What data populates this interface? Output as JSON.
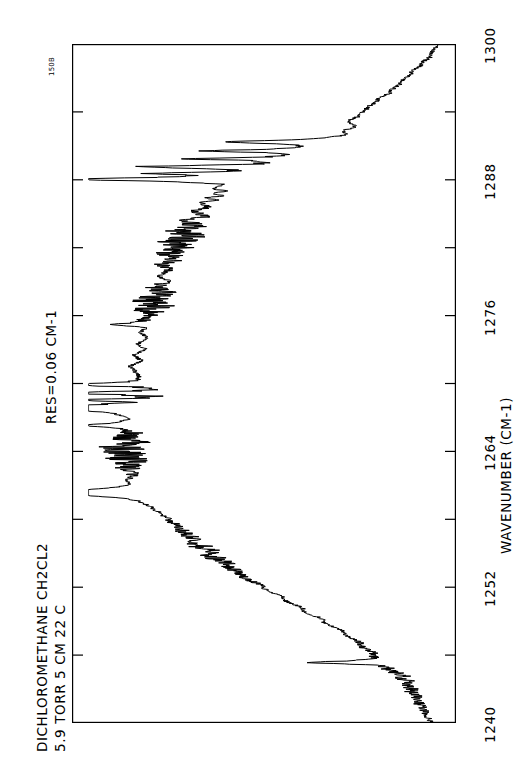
{
  "header": {
    "sample_name": "DICHLOROMETHANE  CH2CL2",
    "conditions": "5.9 TORR  5 CM  22 C",
    "resolution": "RES=0.06 CM-1",
    "spectrum_id": "150B"
  },
  "chart_data": {
    "type": "line",
    "title": "DICHLOROMETHANE  CH2CL2",
    "subtitle": "5.9 TORR  5 CM  22 C",
    "annotations": [
      "RES=0.06 CM-1",
      "150B"
    ],
    "orientation": "rotated-90-clockwise",
    "xlabel": "WAVENUMBER (CM-1)",
    "ylabel": "",
    "xlim": [
      1300,
      1240
    ],
    "ylim": [
      0,
      1
    ],
    "grid": false,
    "legend": null,
    "axis_side": "right",
    "tick_labels": [
      "1300",
      "1288",
      "1276",
      "1264",
      "1252",
      "1240"
    ],
    "tick_values": [
      1300,
      1288,
      1276,
      1264,
      1252,
      1240
    ],
    "minor_tick_values": [
      1294,
      1282,
      1270,
      1258,
      1246
    ],
    "series": [
      {
        "name": "absorbance",
        "description": "IR absorption spectrum of dichloromethane vapor, 1240-1300 cm-1",
        "x": [
          1300.0,
          1299.0,
          1298.2,
          1297.4,
          1296.6,
          1295.8,
          1295.0,
          1294.3,
          1293.7,
          1293.2,
          1292.7,
          1292.3,
          1292.0,
          1291.7,
          1291.4,
          1291.1,
          1290.8,
          1290.5,
          1290.2,
          1290.0,
          1289.8,
          1289.6,
          1289.4,
          1289.2,
          1289.0,
          1288.8,
          1288.6,
          1288.4,
          1288.2,
          1288.0,
          1287.8,
          1287.6,
          1287.4,
          1287.2,
          1287.0,
          1286.8,
          1286.6,
          1286.4,
          1286.2,
          1286.0,
          1285.6,
          1285.2,
          1284.8,
          1284.4,
          1284.0,
          1283.5,
          1283.0,
          1282.5,
          1282.0,
          1281.5,
          1281.0,
          1280.5,
          1280.0,
          1279.5,
          1279.0,
          1278.5,
          1278.0,
          1277.5,
          1277.0,
          1276.5,
          1276.0,
          1275.5,
          1275.0,
          1274.5,
          1274.0,
          1273.5,
          1273.0,
          1272.5,
          1272.0,
          1271.5,
          1271.0,
          1270.6,
          1270.2,
          1269.9,
          1269.6,
          1269.3,
          1269.0,
          1268.7,
          1268.4,
          1268.1,
          1267.8,
          1267.5,
          1267.2,
          1266.9,
          1266.6,
          1266.3,
          1266.0,
          1265.6,
          1265.2,
          1264.8,
          1264.4,
          1264.0,
          1263.5,
          1263.0,
          1262.5,
          1262.0,
          1261.5,
          1261.0,
          1260.5,
          1260.0,
          1259.5,
          1259.0,
          1258.5,
          1258.0,
          1257.5,
          1257.0,
          1256.0,
          1255.0,
          1254.0,
          1253.0,
          1252.0,
          1251.0,
          1250.0,
          1249.0,
          1248.0,
          1247.0,
          1246.0,
          1245.0,
          1244.0,
          1243.0,
          1242.0,
          1241.0,
          1240.0
        ],
        "y": [
          0.0,
          0.02,
          0.05,
          0.08,
          0.11,
          0.14,
          0.18,
          0.21,
          0.23,
          0.26,
          0.24,
          0.27,
          0.25,
          0.28,
          0.3,
          0.32,
          0.34,
          0.33,
          0.36,
          0.38,
          0.4,
          0.42,
          0.41,
          0.44,
          0.46,
          0.48,
          0.5,
          0.52,
          0.55,
          0.57,
          0.6,
          0.58,
          0.62,
          0.64,
          0.61,
          0.66,
          0.63,
          0.68,
          0.65,
          0.7,
          0.68,
          0.72,
          0.7,
          0.74,
          0.72,
          0.76,
          0.74,
          0.78,
          0.76,
          0.8,
          0.78,
          0.82,
          0.8,
          0.83,
          0.81,
          0.84,
          0.82,
          0.85,
          0.83,
          0.86,
          0.84,
          0.87,
          0.85,
          0.88,
          0.86,
          0.89,
          0.87,
          0.9,
          0.88,
          0.91,
          0.89,
          0.87,
          0.84,
          0.8,
          0.76,
          0.72,
          0.7,
          0.74,
          0.78,
          0.82,
          0.86,
          0.88,
          0.9,
          0.89,
          0.91,
          0.9,
          0.92,
          0.9,
          0.93,
          0.91,
          0.94,
          0.92,
          0.93,
          0.91,
          0.92,
          0.9,
          0.91,
          0.89,
          0.9,
          0.88,
          0.86,
          0.84,
          0.82,
          0.8,
          0.78,
          0.76,
          0.72,
          0.68,
          0.63,
          0.58,
          0.52,
          0.46,
          0.4,
          0.34,
          0.28,
          0.23,
          0.18,
          0.14,
          0.1,
          0.08,
          0.06,
          0.04,
          0.02
        ]
      }
    ]
  },
  "axis": {
    "title": "WAVENUMBER (CM-1)",
    "ticks": [
      {
        "label": "1300",
        "value": 1300
      },
      {
        "label": "1288",
        "value": 1288
      },
      {
        "label": "1276",
        "value": 1276
      },
      {
        "label": "1264",
        "value": 1264
      },
      {
        "label": "1252",
        "value": 1252
      },
      {
        "label": "1240",
        "value": 1240
      }
    ]
  },
  "colors": {
    "trace": "#000000",
    "frame": "#000000",
    "background": "#ffffff"
  }
}
